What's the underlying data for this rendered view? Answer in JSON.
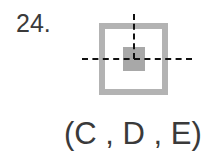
{
  "question": {
    "number": "24.",
    "answer": "(C , D , E)"
  },
  "figure": {
    "outer_square_color": "#b3b3b3",
    "inner_square_color": "#a8a8a8",
    "axis_line_color": "#111111",
    "axis_style": "dashed"
  }
}
